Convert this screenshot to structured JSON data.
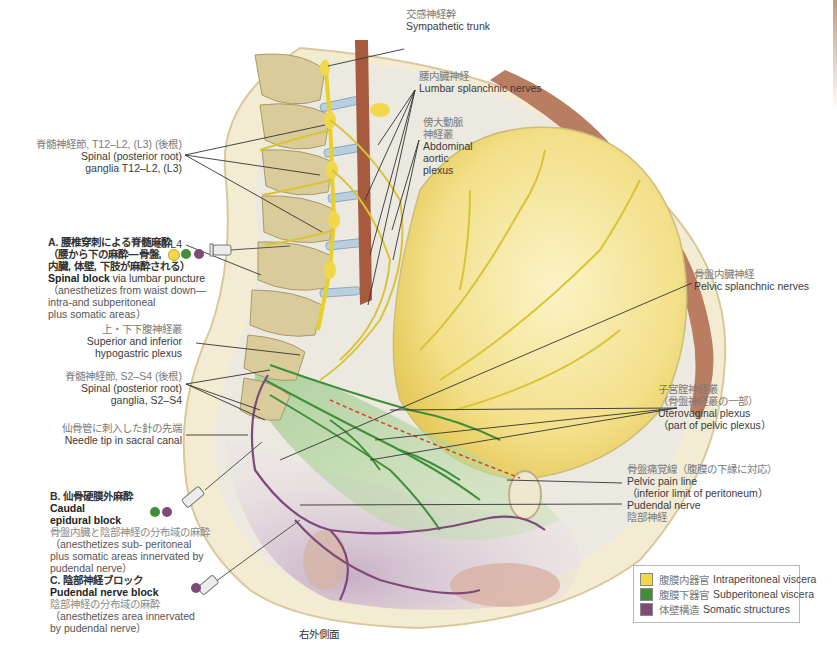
{
  "figure": {
    "caption": "右外側面",
    "colors": {
      "intraperitoneal": "#f0d84a",
      "subperitoneal": "#3f8f3a",
      "somatic": "#7f4a7a",
      "nerve_yellow": "#d9c436",
      "bone": "#d9cc9a",
      "muscle": "#b97d62",
      "pelvic_pain_line": "#d6402e",
      "skin": "#f1e6c4"
    },
    "labels": {
      "sympathetic_trunk": {
        "jp": "交感神経幹",
        "en": "Sympathetic trunk"
      },
      "lumbar_splanchnic": {
        "jp": "腰内臓神経",
        "en": "Lumbar splanchnic nerves"
      },
      "abdominal_aortic_plexus": {
        "jp1": "傍大動脈",
        "jp2": "神経叢",
        "en1": "Abdominal",
        "en2": "aortic",
        "en3": "plexus"
      },
      "spinal_ganglia_t12": {
        "jp": "脊髄神経節, T12–L2, (L3) (後根)",
        "en1": "Spinal (posterior root)",
        "en2": "ganglia T12–L2, (L3)"
      },
      "l3l4": {
        "en": "L3/L4"
      },
      "hypogastric_plexus": {
        "jp": "上・下下腹神経叢",
        "en1": "Superior and inferior",
        "en2": "hypogastric plexus"
      },
      "spinal_ganglia_s2": {
        "jp": "脊髄神経節, S2–S4 (後根)",
        "en1": "Spinal (posterior root)",
        "en2": "ganglia, S2–S4"
      },
      "needle_tip": {
        "jp": "仙骨管に刺入した針の先端",
        "en": "Needle tip in sacral canal"
      },
      "pelvic_splanchnic": {
        "jp": "骨盤内臓神経",
        "en": "Pelvic splanchnic nerves"
      },
      "uterovaginal_plexus": {
        "jp1": "子宮腟神経叢",
        "jp2": "（骨盤神経叢の一部）",
        "en1": "Uterovaginal plexus",
        "en2": "（part of pelvic plexus）"
      },
      "pelvic_pain_line": {
        "jp": "骨盤痛覚線（腹膜の下縁に対応）",
        "en1": "Pelvic pain line",
        "en2": "（inferior limit of peritoneum）"
      },
      "pudendal_nerve": {
        "en": "Pudendal nerve",
        "jp": "陰部神経"
      }
    },
    "blocks": {
      "a": {
        "title_jp1": "A. 腰椎穿刺による脊髄麻酔",
        "title_jp2": "（腰から下の麻酔—骨盤,",
        "title_jp3": "内臓, 体壁, 下肢が麻酔される）",
        "en_bold": "Spinal block",
        "en_rest": " via lumbar puncture",
        "desc1": "（anesthetizes from waist down—",
        "desc2": "intra-and subperitoneal",
        "desc3": "plus somatic areas）",
        "dots": [
          "#f0d84a",
          "#3f8f3a",
          "#7f4a7a"
        ]
      },
      "b": {
        "title_jp": "B. 仙骨硬膜外麻酔",
        "title_en1": "Caudal",
        "title_en2": "epidural block",
        "desc_jp": "骨盤内臓と陰部神経の分布域の麻酔",
        "desc1": "（anesthetizes sub- peritoneal",
        "desc2": "plus somatic areas innervated by",
        "desc3": "pudendal nerve）",
        "dots": [
          "#3f8f3a",
          "#7f4a7a"
        ]
      },
      "c": {
        "title_jp": "C. 陰部神経ブロック",
        "title_en": "Pudendal nerve block",
        "desc_jp": "陰部神経の分布域の麻酔",
        "desc1": "（anesthetizes area innervated",
        "desc2": "by pudendal nerve）",
        "dots": [
          "#7f4a7a"
        ]
      }
    },
    "legend": {
      "items": [
        {
          "jp": "腹膜内器官",
          "en": "Intraperitoneal viscera",
          "color": "#f0d84a"
        },
        {
          "jp": "腹膜下器官",
          "en": "Subperitoneal viscera",
          "color": "#3f8f3a"
        },
        {
          "jp": "体壁構造",
          "en": "Somatic structures",
          "color": "#7f4a7a"
        }
      ]
    }
  }
}
